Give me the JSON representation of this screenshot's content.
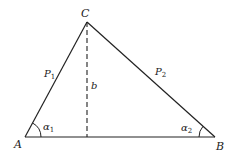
{
  "diagram": {
    "type": "triangle-with-altitude",
    "vertices": {
      "A": {
        "label": "A",
        "x": 25,
        "y": 137
      },
      "B": {
        "label": "B",
        "x": 215,
        "y": 137
      },
      "C": {
        "label": "C",
        "x": 87,
        "y": 22
      }
    },
    "sides": {
      "AC": {
        "label_main": "P",
        "label_sub": "1"
      },
      "BC": {
        "label_main": "P",
        "label_sub": "2"
      }
    },
    "altitude": {
      "label": "b",
      "style": "dashed",
      "from": "C",
      "foot_x": 87,
      "foot_y": 137
    },
    "angles": {
      "alpha1": {
        "label_main": "α",
        "label_sub": "1",
        "at": "A"
      },
      "alpha2": {
        "label_main": "α",
        "label_sub": "2",
        "at": "B"
      }
    },
    "colors": {
      "stroke": "#222222",
      "background": "#ffffff"
    }
  }
}
